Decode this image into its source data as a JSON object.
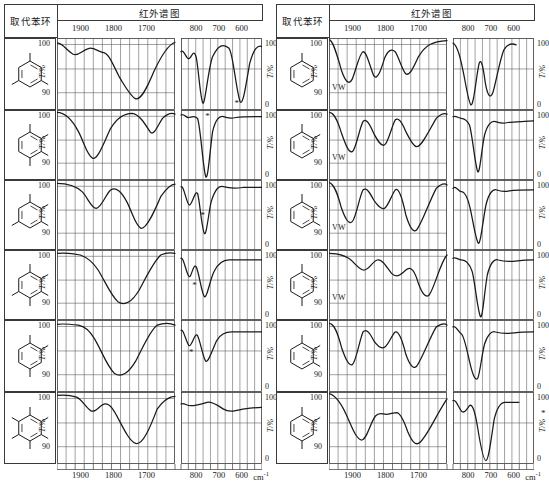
{
  "header": {
    "structure_col_label": "取代苯环",
    "spectrum_col_label": "红外谱图",
    "top_ticks_left_panel": [
      "1900",
      "1800",
      "1700"
    ],
    "top_ticks_right_panel": [
      "800",
      "700",
      "600"
    ]
  },
  "axes": {
    "y_axis_label": "T/%",
    "y_left_ticks": [
      "100",
      "90"
    ],
    "y_right_ticks": [
      "100",
      "0"
    ],
    "x_bottom_ticks_left": [
      "1900",
      "1800",
      "1700"
    ],
    "x_bottom_ticks_right": [
      "800",
      "700",
      "600"
    ],
    "x_unit": "cm",
    "x_unit_exponent": "-1"
  },
  "annotations": {
    "vw_label": "VW",
    "star_marker": "*"
  },
  "colors": {
    "ink": "#1a1a1a",
    "grid": "#555555",
    "frame": "#3a3a3a",
    "background": "#ffffff"
  },
  "left_column": [
    {
      "name": "1,3,5-trimethylbenzene",
      "substituents": [
        1,
        3,
        5
      ],
      "markers": {
        "vw": false,
        "star_panel": "right",
        "star_x": 0.66,
        "star_y": 0.92
      },
      "panel_a": "M0,6 C6,5 10,14 18,19 C24,22 28,14 36,12 C42,11 46,16 52,17 C58,18 62,30 70,46 C76,56 82,68 88,71 C94,72 100,60 108,40 C116,22 124,8 132,5",
      "panel_b": "M0,16 C4,12 8,26 12,24 C16,22 18,12 22,22 C25,30 28,72 32,76 C35,78 40,34 46,22 C54,8 62,6 70,12 C76,18 80,60 86,74 C90,80 94,58 100,30 C106,12 112,8 118,10"
    },
    {
      "name": "1,2,3,4-tetramethylbenzene-like",
      "substituents": [
        1,
        2,
        3,
        4
      ],
      "markers": {
        "vw": false,
        "star_panel": "right",
        "star_x": 0.3,
        "star_y": 0.1
      },
      "panel_a": "M0,3 C8,3 16,10 24,26 C30,38 34,56 40,58 C46,59 52,40 60,22 C68,8 76,4 84,4 C92,5 98,16 104,26 C108,32 112,20 118,10 C124,4 128,3 132,5",
      "panel_b": "M0,6 C4,4 8,10 12,9 C16,8 20,6 24,10 C28,16 32,70 36,80 C39,86 42,50 46,26 C50,12 56,6 62,8 C68,10 74,10 80,9 C90,8 100,8 118,8"
    },
    {
      "name": "1,2,3,5-tetramethylbenzene-like",
      "substituents": [
        1,
        2,
        3,
        5
      ],
      "markers": {
        "vw": false,
        "star_panel": "right",
        "star_x": 0.24,
        "star_y": 0.52
      },
      "panel_a": "M0,4 C10,4 20,6 28,14 C34,20 38,34 44,34 C50,33 54,18 60,12 C66,8 72,14 78,26 C84,38 88,56 94,58 C100,59 108,40 116,20 C124,8 128,5 132,5",
      "panel_b": "M0,8 C4,6 8,28 12,30 C16,31 20,12 24,16 C27,22 30,58 34,64 C37,68 40,40 44,26 C50,10 56,6 62,8 C70,10 80,10 90,9 C100,9 110,9 118,9"
    },
    {
      "name": "pentasubstituted-benzene-ring",
      "substituents": [
        1,
        2,
        3,
        4,
        5
      ],
      "markers": {
        "vw": false,
        "star_panel": "right",
        "star_x": 0.14,
        "star_y": 0.52
      },
      "panel_a": "M0,4 C10,3 18,4 26,6 C34,9 40,14 46,24 C54,38 60,54 68,62 C76,68 84,62 92,48 C100,32 108,14 116,6 C122,3 128,3 132,4",
      "panel_b": "M0,10 C4,8 8,30 12,32 C15,33 18,16 22,20 C26,26 30,52 34,56 C38,58 42,36 48,26 C54,16 62,12 70,12 C84,12 100,12 118,12"
    },
    {
      "name": "1,2,4-trisubstituted-benzene-ring",
      "substituents": [
        1,
        2,
        4
      ],
      "markers": {
        "vw": false,
        "star_panel": "right",
        "star_x": 0.1,
        "star_y": 0.46
      },
      "panel_a": "M0,5 C8,4 16,5 24,6 C32,8 36,12 42,22 C50,36 56,54 64,62 C72,68 80,62 88,48 C96,32 104,12 112,6 C120,3 128,4 132,6",
      "panel_b": "M0,12 C4,10 8,28 12,30 C16,31 20,14 24,18 C28,24 32,44 36,48 C40,50 46,34 52,24 C58,16 66,14 74,14 C88,14 102,14 118,14"
    },
    {
      "name": "hexasubstituted-benzene-ring",
      "substituents": [
        1,
        2,
        3,
        4,
        5,
        6
      ],
      "markers": {
        "vw": false,
        "star_panel": "none",
        "star_x": 0,
        "star_y": 0
      },
      "panel_a": "M0,4 C8,3 16,4 22,6 C28,9 32,18 38,22 C44,25 48,14 54,14 C60,14 64,22 70,34 C76,46 82,58 88,60 C96,62 104,42 112,20 C120,8 128,5 132,5",
      "panel_b": "M0,14 C4,12 8,16 14,16 C22,16 30,14 38,12 C46,11 54,16 62,20 C70,24 80,22 90,20 C100,19 110,18 118,18"
    }
  ],
  "right_column": [
    {
      "name": "benzene-monosubstituted",
      "substituents": [
        1
      ],
      "markers": {
        "vw": true,
        "star_panel": "none",
        "star_x": 0,
        "star_y": 0
      },
      "panel_a": "M0,2 C4,2 8,16 14,38 C18,50 22,56 26,48 C30,38 34,18 38,16 C42,15 46,34 50,44 C54,50 58,38 62,24 C66,14 70,12 74,16 C78,22 82,38 86,42 C90,44 94,36 100,22 C108,8 116,4 132,3",
      "panel_b": "M0,6 C6,8 10,20 14,36 C18,50 22,74 26,78 C30,80 34,44 38,30 C41,22 44,34 47,52 C50,66 54,72 58,64 C62,54 68,26 74,14 C80,6 86,6 92,8"
    },
    {
      "name": "ortho-xylene",
      "substituents": [
        1,
        2
      ],
      "markers": {
        "vw": true,
        "star_panel": "none",
        "star_x": 0,
        "star_y": 0
      },
      "panel_a": "M0,3 C6,3 10,14 14,28 C18,40 22,52 26,50 C30,48 34,22 38,14 C42,9 46,18 50,28 C54,36 58,44 62,42 C66,40 70,20 74,12 C78,8 82,16 86,26 C90,34 94,44 98,44 C104,44 112,24 120,10 C126,4 130,4 132,5",
      "panel_b": "M0,8 C4,6 8,10 12,10 C16,10 20,12 24,18 C28,28 32,66 36,74 C39,78 42,44 46,30 C50,18 56,12 62,14 C68,16 74,16 80,15 C90,14 100,14 118,13"
    },
    {
      "name": "meta-xylene",
      "substituents": [
        1,
        3
      ],
      "markers": {
        "vw": true,
        "star_panel": "none",
        "star_x": 0,
        "star_y": 0
      },
      "panel_a": "M0,3 C6,4 10,18 14,34 C18,46 22,54 26,50 C30,46 34,20 38,12 C42,8 46,16 50,24 C54,30 58,36 62,34 C66,32 70,18 74,12 C78,8 82,22 86,42 C90,56 94,64 98,60 C104,52 112,26 120,10 C126,4 130,4 132,6",
      "panel_b": "M0,10 C4,6 8,14 12,14 C17,14 21,20 25,34 C29,48 33,72 37,76 C40,78 44,46 48,30 C52,16 58,10 64,12 C70,14 76,14 82,13 C92,12 102,12 118,12"
    },
    {
      "name": "para-xylene",
      "substituents": [
        1,
        4
      ],
      "markers": {
        "vw": true,
        "star_panel": "none",
        "star_x": 0,
        "star_y": 0
      },
      "panel_a": "M0,4 C8,4 16,6 22,10 C28,14 32,22 38,24 C44,26 48,14 54,12 C60,11 64,20 70,28 C76,34 80,30 86,24 C92,18 96,26 100,40 C104,52 108,58 112,54 C118,46 124,16 132,6",
      "panel_b": "M0,10 C4,8 8,12 12,12 C18,12 24,16 28,26 C32,38 36,74 40,80 C43,84 46,48 50,30 C54,16 60,10 66,12 C74,14 84,14 94,13 C104,12 112,12 118,12"
    },
    {
      "name": "1,2,3-trimethylbenzene",
      "substituents": [
        1,
        2,
        3
      ],
      "markers": {
        "vw": false,
        "star_panel": "none",
        "star_x": 0,
        "star_y": 0
      },
      "panel_a": "M0,4 C6,4 10,16 14,32 C18,44 22,54 26,52 C30,50 34,24 38,14 C42,9 46,16 50,24 C54,30 58,34 62,32 C66,30 70,18 74,14 C78,12 82,24 86,40 C90,52 94,58 98,54 C104,46 112,22 120,8 C126,4 130,4 132,6",
      "panel_b": "M0,8 C4,6 8,14 12,16 C16,18 20,34 24,48 C28,62 32,72 36,68 C39,64 42,40 46,28 C50,18 56,12 62,14 C70,16 80,16 90,15 C100,14 110,14 118,14"
    },
    {
      "name": "1,2,4-trimethylbenzene",
      "substituents": [
        1,
        2,
        4
      ],
      "markers": {
        "vw": false,
        "star_panel": "right-outside",
        "star_x": 0.0,
        "star_y": 0.3
      },
      "panel_a": "M0,2 C8,4 14,14 20,28 C26,42 30,54 36,56 C42,57 46,36 52,28 C56,23 60,26 64,26 C68,26 72,24 76,24 C80,25 84,34 88,46 C92,56 96,62 100,60 C108,56 118,30 132,8",
      "panel_b": "M0,10 C4,8 8,18 12,22 C16,26 20,20 24,16 C28,13 32,22 36,42 C40,62 44,80 48,80 C52,80 56,52 60,32 C64,18 70,12 76,12 C84,12 90,12 96,12"
    }
  ]
}
